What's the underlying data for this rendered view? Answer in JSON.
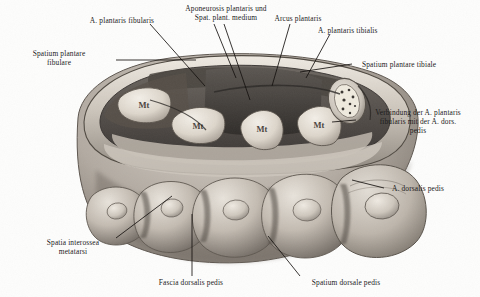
{
  "figure": {
    "type": "anatomical-illustration",
    "style": "grayscale halftone engraving",
    "background_color": "#fdfdfc",
    "ink_color": "#1b1b1b"
  },
  "labels": [
    {
      "id": "a-plantaris-fibularis",
      "text": "A. plantaris fibularis",
      "align": "center"
    },
    {
      "id": "aponeurosis-plantaris",
      "text": "Aponeurosis plantaris und\nSpat. plant. medium",
      "align": "center"
    },
    {
      "id": "arcus-plantaris",
      "text": "Arcus plantaris",
      "align": "center"
    },
    {
      "id": "a-plantaris-tibialis",
      "text": "A. plantaris tibialis",
      "align": "left"
    },
    {
      "id": "spatium-plantare-fibulare",
      "text": "Spatium plantare\nfibulare",
      "align": "center"
    },
    {
      "id": "spatium-plantare-tibiale",
      "text": "Spatium plantare tibiale",
      "align": "left"
    },
    {
      "id": "verbindung-a-plantaris",
      "text": "Verbindung der A. plantaris\nfibularis mit der A. dors.\npedis",
      "align": "center"
    },
    {
      "id": "a-dorsalis-pedis",
      "text": "A. dorsalis pedis",
      "align": "left"
    },
    {
      "id": "spatia-interossea-metatarsi",
      "text": "Spatia interossea\nmetatarsi",
      "align": "center"
    },
    {
      "id": "fascia-dorsalis-pedis",
      "text": "Fascia dorsalis pedis",
      "align": "center"
    },
    {
      "id": "spatium-dorsale-pedis",
      "text": "Spatium dorsale pedis",
      "align": "center"
    }
  ],
  "bone_marks": [
    {
      "id": "metatarsal-1",
      "text": "Mt"
    },
    {
      "id": "metatarsal-2",
      "text": "Mt"
    },
    {
      "id": "metatarsal-3",
      "text": "Mt"
    },
    {
      "id": "metatarsal-4",
      "text": "Mt"
    }
  ]
}
